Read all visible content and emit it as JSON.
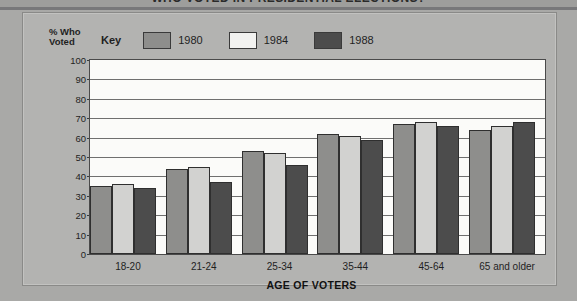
{
  "title": "WHO VOTED IN PRESIDENTIAL ELECTIONS?",
  "legend": {
    "key_label": "Key",
    "entries": [
      {
        "label": "1980",
        "color": "#8e8e8c"
      },
      {
        "label": "1984",
        "color": "#f2f2f0"
      },
      {
        "label": "1988",
        "color": "#4c4c4c"
      }
    ]
  },
  "y_axis": {
    "caption_line1": "% Who",
    "caption_line2": "Voted",
    "ticks": [
      "100",
      "90",
      "80",
      "70",
      "60",
      "50",
      "40",
      "30",
      "20",
      "10",
      "0"
    ]
  },
  "x_axis": {
    "title": "AGE OF VOTERS",
    "categories": [
      "18-20",
      "21-24",
      "25-34",
      "35-44",
      "45-64",
      "65 and older"
    ]
  },
  "chart_data": {
    "type": "bar",
    "title": "WHO VOTED IN PRESIDENTIAL ELECTIONS?",
    "xlabel": "AGE OF VOTERS",
    "ylabel": "% Who Voted",
    "ylim": [
      0,
      100
    ],
    "ytick_step": 10,
    "grid": true,
    "legend_position": "top",
    "categories": [
      "18-20",
      "21-24",
      "25-34",
      "35-44",
      "45-64",
      "65 and older"
    ],
    "series": [
      {
        "name": "1980",
        "color": "#8e8e8c",
        "values": [
          35,
          44,
          53,
          62,
          67,
          64
        ]
      },
      {
        "name": "1984",
        "color": "#f2f2f0",
        "values": [
          36,
          45,
          52,
          61,
          68,
          66
        ]
      },
      {
        "name": "1988",
        "color": "#4c4c4c",
        "values": [
          34,
          37,
          46,
          59,
          66,
          68
        ]
      }
    ]
  }
}
